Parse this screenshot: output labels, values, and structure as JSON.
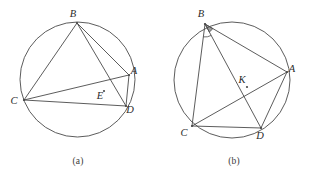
{
  "plate": {
    "width": 312,
    "height": 183,
    "background": "#ffffff",
    "stroke_color": "#4a4a4a",
    "label_color": "#2b2b2b"
  },
  "figures": [
    {
      "id": "figure-a",
      "caption": "(a)",
      "circle": {
        "cx": 77.5,
        "cy": 79.5,
        "r": 57.5
      },
      "points": [
        {
          "name": "B",
          "x": 77.0,
          "y": 23.0,
          "label_x": 73.0,
          "label_y": 17.0
        },
        {
          "name": "A",
          "x": 129.0,
          "y": 75.0,
          "label_x": 134.0,
          "label_y": 74.0
        },
        {
          "name": "D",
          "x": 126.0,
          "y": 106.0,
          "label_x": 130.0,
          "label_y": 113.0
        },
        {
          "name": "C",
          "x": 24.0,
          "y": 100.0,
          "label_x": 14.0,
          "label_y": 104.0
        },
        {
          "name": "E",
          "x": 104.0,
          "y": 91.0,
          "label_x": 100.0,
          "label_y": 99.0
        }
      ],
      "segments": [
        {
          "from": "B",
          "to": "C"
        },
        {
          "from": "B",
          "to": "A"
        },
        {
          "from": "B",
          "to": "D"
        },
        {
          "from": "C",
          "to": "A"
        },
        {
          "from": "C",
          "to": "D"
        },
        {
          "from": "A",
          "to": "D"
        }
      ],
      "angle_marks": []
    },
    {
      "id": "figure-b",
      "caption": "(b)",
      "circle": {
        "cx": 76.0,
        "cy": 80.0,
        "r": 58.0
      },
      "points": [
        {
          "name": "B",
          "x": 49.0,
          "y": 24.0,
          "label_x": 45.0,
          "label_y": 17.0
        },
        {
          "name": "A",
          "x": 131.0,
          "y": 72.0,
          "label_x": 136.0,
          "label_y": 72.0
        },
        {
          "name": "D",
          "x": 105.0,
          "y": 128.0,
          "label_x": 104.0,
          "label_y": 139.0
        },
        {
          "name": "C",
          "x": 36.0,
          "y": 126.0,
          "label_x": 28.0,
          "label_y": 136.0
        },
        {
          "name": "K",
          "x": 91.0,
          "y": 87.0,
          "label_x": 86.0,
          "label_y": 83.0
        }
      ],
      "segments": [
        {
          "from": "B",
          "to": "C"
        },
        {
          "from": "B",
          "to": "D"
        },
        {
          "from": "B",
          "to": "A"
        },
        {
          "from": "C",
          "to": "A"
        },
        {
          "from": "C",
          "to": "D"
        },
        {
          "from": "A",
          "to": "D"
        }
      ],
      "angle_marks": [
        {
          "vertex": "B",
          "kind": "filled-wedge",
          "radius": 9
        },
        {
          "vertex": "B",
          "kind": "arc",
          "radius": 13
        }
      ]
    }
  ]
}
